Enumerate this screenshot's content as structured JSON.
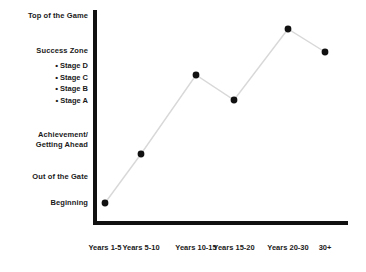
{
  "chart_data": {
    "type": "line",
    "title": "",
    "xlabel": "",
    "ylabel": "",
    "categories": [
      "Years 1-5",
      "Years 5-10",
      "Years 10-15",
      "Years 15-20",
      "Years 20-30",
      "30+"
    ],
    "y_category_labels": [
      "Beginning",
      "Out of the Gate",
      "Achievement/ Getting Ahead",
      "Success Zone",
      "Top of the Game"
    ],
    "values": [
      1.0,
      2.15,
      4.2,
      3.05,
      5.7,
      4.65
    ],
    "ylim": [
      0.4,
      6.2
    ],
    "grid": false,
    "legend": null,
    "marker": "circle",
    "marker_color": "#111111",
    "line_color": "#d8d8d8",
    "points": [
      {
        "x": 105,
        "y": 203,
        "category": "Years 1-5"
      },
      {
        "x": 141,
        "y": 154,
        "category": "Years 5-10"
      },
      {
        "x": 196,
        "y": 75,
        "category": "Years 10-15"
      },
      {
        "x": 234,
        "y": 100,
        "category": "Years 15-20"
      },
      {
        "x": 288,
        "y": 29,
        "category": "Years 20-30"
      },
      {
        "x": 325,
        "y": 52,
        "category": "30+"
      }
    ]
  },
  "axis": {
    "y_labels": [
      {
        "id": "top",
        "text": "Top of the Game"
      },
      {
        "id": "success",
        "text": "Success Zone"
      },
      {
        "id": "achieve",
        "line1": "Achievement/",
        "line2": "Getting Ahead"
      },
      {
        "id": "gate",
        "text": "Out of the Gate"
      },
      {
        "id": "begin",
        "text": "Beginning"
      }
    ],
    "x_labels": [
      {
        "text": "Years 1-5",
        "cx": 105
      },
      {
        "text": "Years 5-10",
        "cx": 141
      },
      {
        "text": "Years 10-15",
        "cx": 196
      },
      {
        "text": "Years 15-20",
        "cx": 234
      },
      {
        "text": "Years 20-30",
        "cx": 288
      },
      {
        "text": "30+",
        "cx": 325
      }
    ]
  },
  "stages": {
    "bullet": "•",
    "items": [
      "Stage D",
      "Stage C",
      "Stage B",
      "Stage A"
    ]
  },
  "colors": {
    "axis": "#111111",
    "marker": "#111111",
    "line": "#d8d8d8",
    "text": "#1a1a1a",
    "background": "#ffffff"
  }
}
